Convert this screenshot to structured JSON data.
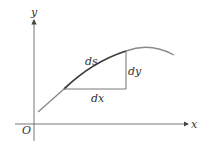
{
  "figure": {
    "axes": {
      "x_label": "x",
      "y_label": "y",
      "origin_label": "O"
    },
    "segment_labels": {
      "arc": "ds",
      "vertical": "dy",
      "horizontal": "dx"
    },
    "colors": {
      "axis": "#555555",
      "curve_light": "#8a8a8a",
      "curve_dark": "#3a3a3a",
      "triangle": "#7a7a7a",
      "text": "#333333"
    }
  }
}
